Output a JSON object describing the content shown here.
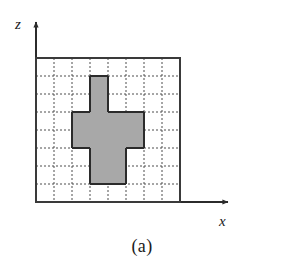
{
  "figure": {
    "caption": "(a)",
    "axes": {
      "vertical_label": "z",
      "horizontal_label": "x",
      "origin_x_px": 36,
      "origin_y_px": 202,
      "vertical_arrow_tip_y_px": 18,
      "horizontal_arrow_tip_x_px": 232
    },
    "plot_frame": {
      "left_px": 36,
      "top_px": 58,
      "right_px": 180,
      "bottom_px": 202,
      "border_color": "#3a3a3a",
      "border_width_px": 2,
      "fill_color": "#ffffff"
    },
    "grid": {
      "columns": 8,
      "rows": 8,
      "cell_width_px": 18,
      "cell_height_px": 18,
      "line_style": "dashed",
      "line_color": "#4d4d4d",
      "line_width_px": 1,
      "dash_pattern": "2,2"
    },
    "shaded_region": {
      "fill_color": "#a8a8a8",
      "outline_color": "#2b2b2b",
      "outline_width_px": 2,
      "description": "cross-shaped set of shaded unit cells",
      "cells": [
        {
          "col": 3,
          "row": 1
        },
        {
          "col": 3,
          "row": 2
        },
        {
          "col": 2,
          "row": 3
        },
        {
          "col": 3,
          "row": 3
        },
        {
          "col": 4,
          "row": 3
        },
        {
          "col": 5,
          "row": 3
        },
        {
          "col": 2,
          "row": 4
        },
        {
          "col": 3,
          "row": 4
        },
        {
          "col": 4,
          "row": 4
        },
        {
          "col": 5,
          "row": 4
        },
        {
          "col": 3,
          "row": 5
        },
        {
          "col": 4,
          "row": 5
        },
        {
          "col": 3,
          "row": 6
        },
        {
          "col": 4,
          "row": 6
        }
      ],
      "cell_count": 14
    }
  },
  "chart_data": {
    "type": "heatmap",
    "title": "(a)",
    "xlabel": "x",
    "ylabel": "z",
    "grid": true,
    "legend": "none",
    "columns": 8,
    "rows": 8,
    "xlim": [
      0,
      8
    ],
    "ylim": [
      0,
      8
    ],
    "xticks": [
      0,
      1,
      2,
      3,
      4,
      5,
      6,
      7,
      8
    ],
    "yticks": [
      0,
      1,
      2,
      3,
      4,
      5,
      6,
      7,
      8
    ],
    "xticklabels": [
      "",
      "",
      "",
      "",
      "",
      "",
      "",
      "",
      ""
    ],
    "yticklabels": [
      "",
      "",
      "",
      "",
      "",
      "",
      "",
      "",
      ""
    ],
    "values": [
      [
        0,
        0,
        0,
        0,
        0,
        0,
        0,
        0
      ],
      [
        0,
        0,
        0,
        1,
        0,
        0,
        0,
        0
      ],
      [
        0,
        0,
        0,
        1,
        0,
        0,
        0,
        0
      ],
      [
        0,
        0,
        1,
        1,
        1,
        1,
        0,
        0
      ],
      [
        0,
        0,
        1,
        1,
        1,
        1,
        0,
        0
      ],
      [
        0,
        0,
        0,
        1,
        1,
        0,
        0,
        0
      ],
      [
        0,
        0,
        0,
        1,
        1,
        0,
        0,
        0
      ],
      [
        0,
        0,
        0,
        0,
        0,
        0,
        0,
        0
      ]
    ],
    "colors": {
      "0": "#ffffff",
      "1": "#a8a8a8"
    }
  }
}
